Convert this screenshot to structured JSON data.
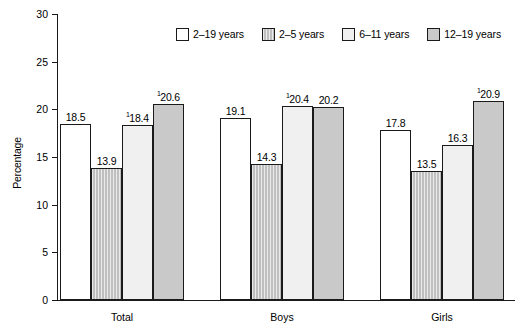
{
  "chart_data": {
    "type": "bar",
    "title": "",
    "xlabel": "",
    "ylabel": "Percentage",
    "ylim": [
      0,
      30
    ],
    "yticks": [
      0,
      5,
      10,
      15,
      20,
      25,
      30
    ],
    "ytick_labels": [
      "0",
      "5",
      "10",
      "15",
      "20",
      "25",
      "30"
    ],
    "grid": false,
    "legend_position": "top-right",
    "categories": [
      "Total",
      "Boys",
      "Girls"
    ],
    "series": [
      {
        "name": "2–19 years",
        "fill": "white",
        "values": [
          18.5,
          19.1,
          17.8
        ],
        "labels": [
          "18.5",
          "19.1",
          "17.8"
        ],
        "footnotes": [
          "",
          "",
          ""
        ]
      },
      {
        "name": "2–5 years",
        "fill": "hatch",
        "values": [
          13.9,
          14.3,
          13.5
        ],
        "labels": [
          "13.9",
          "14.3",
          "13.5"
        ],
        "footnotes": [
          "",
          "",
          ""
        ]
      },
      {
        "name": "6–11 years",
        "fill": "light",
        "values": [
          18.4,
          20.4,
          16.3
        ],
        "labels": [
          "18.4",
          "20.4",
          "16.3"
        ],
        "footnotes": [
          "1",
          "1",
          ""
        ]
      },
      {
        "name": "12–19 years",
        "fill": "gray",
        "values": [
          20.6,
          20.2,
          20.9
        ],
        "labels": [
          "20.6",
          "20.2",
          "20.9"
        ],
        "footnotes": [
          "1",
          "",
          "1"
        ]
      }
    ],
    "colors": {
      "outline": "#1a1a1a",
      "series_2_19": "#ffffff",
      "series_2_5": "#d0d0d0",
      "series_6_11": "#f0f0f0",
      "series_12_19": "#c9c9c9",
      "background": "#ffffff",
      "text": "#000000"
    }
  },
  "legend": {
    "items": [
      {
        "label": "2–19 years"
      },
      {
        "label": "2–5 years"
      },
      {
        "label": "6–11 years"
      },
      {
        "label": "12–19 years"
      }
    ]
  },
  "axes": {
    "y_title": "Percentage",
    "y_ticks": [
      {
        "label": "30"
      },
      {
        "label": "25"
      },
      {
        "label": "20"
      },
      {
        "label": "15"
      },
      {
        "label": "10"
      },
      {
        "label": "5"
      },
      {
        "label": "0"
      }
    ],
    "x_categories": [
      {
        "label": "Total"
      },
      {
        "label": "Boys"
      },
      {
        "label": "Girls"
      }
    ]
  }
}
